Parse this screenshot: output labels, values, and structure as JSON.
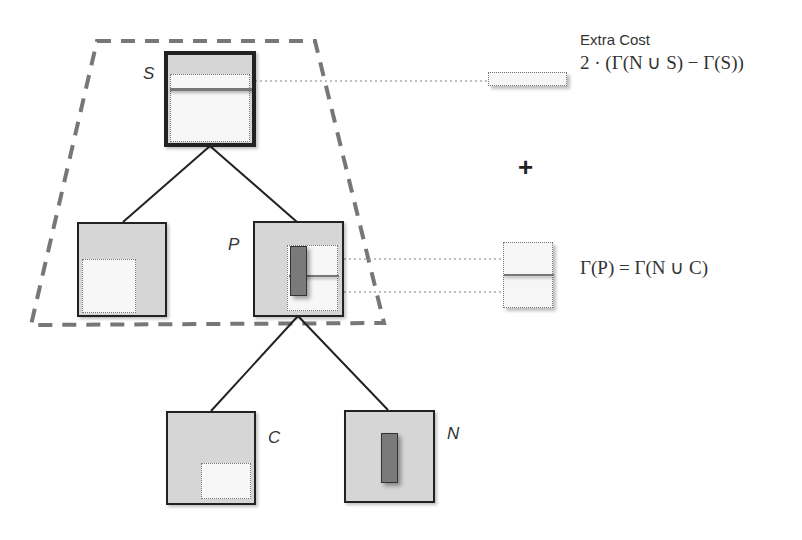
{
  "diagram": {
    "nodes": {
      "S": {
        "label": "S"
      },
      "left": {
        "label": ""
      },
      "P": {
        "label": "P"
      },
      "C": {
        "label": "C"
      },
      "N": {
        "label": "N"
      }
    },
    "legend": {
      "extra_cost": {
        "heading": "Extra Cost",
        "formula": "2 · (Γ(N ∪ S) − Γ(S))"
      },
      "operator": "+",
      "parent_cost": {
        "formula": "Γ(P) = Γ(N ∪ C)"
      }
    },
    "colors": {
      "node_fill": "#d6d6d6",
      "region_fill": "#f7f7f7",
      "object_fill": "#7a7a7a",
      "dashed_outline": "#777777",
      "edge": "#222222"
    }
  }
}
